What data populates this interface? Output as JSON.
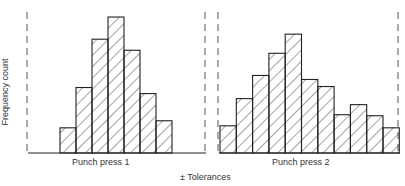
{
  "chart_data": {
    "type": "bar",
    "title": "",
    "xlabel": "± Tolerances",
    "ylabel": "Frequency count",
    "grid": false,
    "legend": null,
    "style": "hatched histogram, no tick labels",
    "panels": [
      {
        "name": "Punch press 1",
        "bins": [
          1,
          2,
          3,
          4,
          5,
          6,
          7
        ],
        "values": [
          2.5,
          6.5,
          11.3,
          13.5,
          10.2,
          5.9,
          3.2
        ]
      },
      {
        "name": "Punch press 2",
        "bins": [
          1,
          2,
          3,
          4,
          5,
          6,
          7,
          8,
          9,
          10,
          11
        ],
        "values": [
          2.7,
          5.4,
          7.7,
          9.9,
          11.8,
          7.3,
          6.6,
          3.8,
          4.8,
          3.7,
          2.5
        ]
      }
    ],
    "ylim": [
      0,
      14
    ]
  },
  "labels": {
    "panel1": "Punch press 1",
    "panel2": "Punch press 2",
    "xlabel": "± Tolerances",
    "ylabel": "Frequency count"
  }
}
